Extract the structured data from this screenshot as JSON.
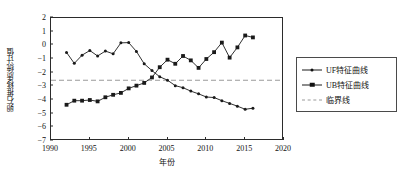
{
  "chart_data": {
    "type": "line",
    "title": "",
    "xlabel": "年份",
    "ylabel": "卵石推移质统计值",
    "xlim": [
      1990,
      2020
    ],
    "ylim": [
      -7,
      2
    ],
    "xticks": [
      1990,
      1995,
      2000,
      2005,
      2010,
      2015,
      2020
    ],
    "yticks": [
      2,
      1,
      0,
      -1,
      -2,
      -3,
      -4,
      -5,
      -6,
      -7
    ],
    "grid": false,
    "legend_position": "right-outside",
    "x": [
      1992,
      1993,
      1994,
      1995,
      1996,
      1997,
      1998,
      1999,
      2000,
      2001,
      2002,
      2003,
      2004,
      2005,
      2006,
      2007,
      2008,
      2009,
      2010,
      2011,
      2012,
      2013,
      2014,
      2015,
      2016
    ],
    "series": [
      {
        "name": "UF特征曲线",
        "marker": "dot",
        "linestyle": "solid",
        "color": "#1a1a1a",
        "values": [
          -0.52,
          -1.32,
          -0.72,
          -0.38,
          -0.78,
          -0.42,
          -0.62,
          0.18,
          0.2,
          -0.45,
          -1.35,
          -1.85,
          -2.3,
          -2.55,
          -2.95,
          -3.1,
          -3.35,
          -3.55,
          -3.78,
          -3.82,
          -4.05,
          -4.25,
          -4.45,
          -4.68,
          -4.6
        ]
      },
      {
        "name": "UB特征曲线",
        "marker": "square",
        "linestyle": "solid",
        "color": "#1a1a1a",
        "values": [
          -4.35,
          -4.05,
          -4.05,
          -4.0,
          -4.1,
          -3.8,
          -3.62,
          -3.48,
          -3.15,
          -2.95,
          -2.75,
          -2.35,
          -1.6,
          -1.05,
          -1.35,
          -0.78,
          -1.1,
          -1.65,
          -1.0,
          -0.5,
          0.2,
          -0.9,
          -0.15,
          0.72,
          0.58
        ]
      }
    ],
    "threshold": {
      "name": "临界线",
      "value": -2.55,
      "linestyle": "dashed",
      "color": "#9a9a9a"
    }
  },
  "legend": {
    "items": [
      {
        "label": "UF特征曲线",
        "symbol": "line-dot"
      },
      {
        "label": "UB特征曲线",
        "symbol": "line-square"
      },
      {
        "label": "临界线",
        "symbol": "dashed-line"
      }
    ]
  }
}
